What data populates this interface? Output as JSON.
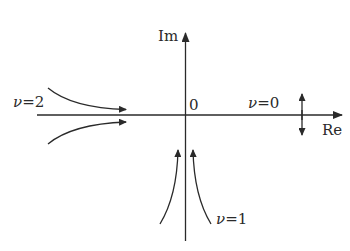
{
  "diagram": {
    "type": "complex-plane-trajectories",
    "axes": {
      "imaginary_label": "Im",
      "real_label": "Re",
      "origin_label": "0"
    },
    "labels": {
      "nu2": {
        "symbol": "ν",
        "eq": "=2"
      },
      "nu0": {
        "symbol": "ν",
        "eq": "=0"
      },
      "nu1": {
        "symbol": "ν",
        "eq": "=1"
      }
    },
    "colors": {
      "stroke": "#2a2a2a",
      "background": "#ffffff"
    }
  }
}
